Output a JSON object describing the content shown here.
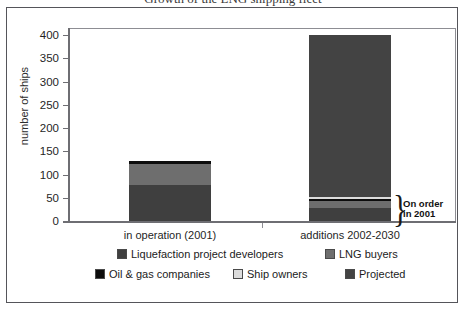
{
  "figure": {
    "title_clipped": "Growth of the LNG shipping fleet",
    "y_axis_title": "number of ships"
  },
  "annotation": {
    "brace": "}",
    "line1": "On order",
    "line2": "in 2001"
  },
  "legend": {
    "items": [
      {
        "label": "Liquefaction project developers",
        "color": "#3f3f3f"
      },
      {
        "label": "LNG buyers",
        "color": "#6e6e6e"
      },
      {
        "label": "Oil & gas companies",
        "color": "#0d0d0d"
      },
      {
        "label": "Ship owners",
        "color": "#dcdcdc"
      },
      {
        "label": "Projected",
        "color": "#434343"
      }
    ]
  },
  "chart_data": {
    "type": "bar",
    "title": "Growth of the LNG shipping fleet",
    "xlabel": "",
    "ylabel": "number of ships",
    "ylim": [
      0,
      400
    ],
    "yticks": [
      0,
      50,
      100,
      150,
      200,
      250,
      300,
      350,
      400
    ],
    "ytick_labels": [
      "0",
      "50",
      "100",
      "150",
      "200",
      "250",
      "300",
      "350",
      "400"
    ],
    "grid": false,
    "stacked": true,
    "legend_position": "bottom",
    "categories": [
      "in operation (2001)",
      "additions 2002-2030"
    ],
    "series": [
      {
        "name": "Liquefaction project developers",
        "color": "#3f3f3f",
        "values": [
          78,
          28
        ]
      },
      {
        "name": "LNG buyers",
        "color": "#6e6e6e",
        "values": [
          44,
          14
        ]
      },
      {
        "name": "Oil & gas companies",
        "color": "#0d0d0d",
        "values": [
          6,
          6
        ]
      },
      {
        "name": "Ship owners",
        "color": "#dcdcdc",
        "values": [
          0,
          4
        ]
      },
      {
        "name": "Projected",
        "color": "#434343",
        "values": [
          0,
          348
        ]
      }
    ],
    "totals": [
      128,
      400
    ],
    "annotations": [
      {
        "text": "On order in 2001",
        "category": "additions 2002-2030",
        "range": [
          0,
          52
        ]
      }
    ]
  }
}
